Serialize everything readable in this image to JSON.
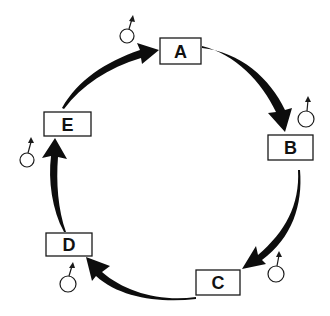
{
  "diagram": {
    "type": "cycle",
    "nodes": [
      {
        "id": "A",
        "label": "A",
        "symbol": "male-symbol"
      },
      {
        "id": "B",
        "label": "B",
        "symbol": "male-symbol"
      },
      {
        "id": "C",
        "label": "C",
        "symbol": "male-symbol"
      },
      {
        "id": "D",
        "label": "D",
        "symbol": "male-symbol"
      },
      {
        "id": "E",
        "label": "E",
        "symbol": "male-symbol"
      }
    ],
    "edges": [
      {
        "from": "A",
        "to": "B"
      },
      {
        "from": "B",
        "to": "C"
      },
      {
        "from": "C",
        "to": "D"
      },
      {
        "from": "D",
        "to": "E"
      },
      {
        "from": "E",
        "to": "A"
      }
    ],
    "colors": {
      "arrow": "#0d0d0d",
      "box_border": "#1a1a1a",
      "background": "#ffffff"
    }
  }
}
